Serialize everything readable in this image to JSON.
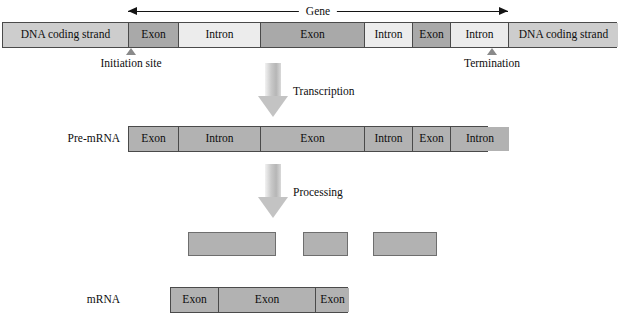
{
  "diagram": {
    "gene_span": {
      "label": "Gene",
      "left_px": 128,
      "right_px": 508
    },
    "colors": {
      "dna_strand": "#cdcdcd",
      "exon": "#a9a9a9",
      "intron": "#ececec",
      "rna_block": "#b2b2b2",
      "outline": "#4a4a4a",
      "arrow_fill": "#c3c3c3",
      "marker": "#8a8a8a",
      "text": "#0d0d0d",
      "background": "#ffffff"
    },
    "dna_row": {
      "name": "dna-coding-strand-row",
      "segments": [
        {
          "label": "DNA coding strand",
          "kind": "dna",
          "width": 126
        },
        {
          "label": "Exon",
          "kind": "exon",
          "width": 50
        },
        {
          "label": "Intron",
          "kind": "intron",
          "width": 82
        },
        {
          "label": "Exon",
          "kind": "exon",
          "width": 104
        },
        {
          "label": "Intron",
          "kind": "intron",
          "width": 48
        },
        {
          "label": "Exon",
          "kind": "exon",
          "width": 38
        },
        {
          "label": "Intron",
          "kind": "intron",
          "width": 58
        },
        {
          "label": "DNA coding strand",
          "kind": "dna",
          "width": 109
        }
      ]
    },
    "markers": [
      {
        "label": "Initiation site",
        "name": "initiation-site"
      },
      {
        "label": "Termination",
        "name": "termination-site"
      }
    ],
    "steps": [
      {
        "label": "Transcription",
        "name": "transcription"
      },
      {
        "label": "Processing",
        "name": "processing"
      }
    ],
    "premrna_row": {
      "name": "pre-mrna-row",
      "label": "Pre-mRNA",
      "segments": [
        {
          "label": "Exon",
          "kind": "rna",
          "width": 50
        },
        {
          "label": "Intron",
          "kind": "rna",
          "width": 82
        },
        {
          "label": "Exon",
          "kind": "rna",
          "width": 104
        },
        {
          "label": "Intron",
          "kind": "rna",
          "width": 48
        },
        {
          "label": "Exon",
          "kind": "rna",
          "width": 38
        },
        {
          "label": "Intron",
          "kind": "rna",
          "width": 58
        }
      ]
    },
    "spliced_blocks": {
      "name": "spliced-intron-blocks",
      "blocks": [
        {
          "left": 188,
          "width": 88
        },
        {
          "left": 303,
          "width": 45
        },
        {
          "left": 373,
          "width": 64
        }
      ]
    },
    "mrna_row": {
      "name": "mrna-row",
      "label": "mRNA",
      "segments": [
        {
          "label": "Exon",
          "kind": "rna",
          "width": 48
        },
        {
          "label": "Exon",
          "kind": "rna",
          "width": 97
        },
        {
          "label": "Exon",
          "kind": "rna",
          "width": 33
        }
      ]
    }
  }
}
